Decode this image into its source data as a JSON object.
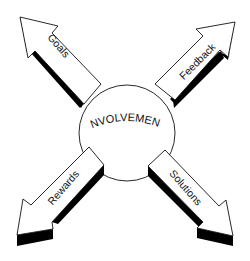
{
  "diagram": {
    "center": {
      "label": "INVOLVEMENT"
    },
    "arrows": [
      {
        "label": "Goals",
        "direction": "up-left"
      },
      {
        "label": "Feedback",
        "direction": "up-right"
      },
      {
        "label": "Rewards",
        "direction": "down-left"
      },
      {
        "label": "Solutions",
        "direction": "down-right"
      }
    ],
    "colors": {
      "stroke": "#111111",
      "fill": "#ffffff",
      "shadow": "#000000"
    }
  }
}
